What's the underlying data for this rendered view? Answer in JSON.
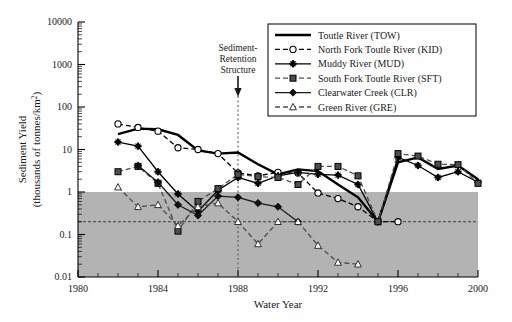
{
  "chart_data": {
    "type": "line",
    "title": "",
    "xlabel": "Water Year",
    "ylabel": "Sediment Yield\n(thousands of tonnes/km2)",
    "ylabel_line1": "Sediment Yield",
    "ylabel_line2": "(thousands of tonnes/km",
    "ylabel_sup": "2",
    "ylabel_close": ")",
    "yscale": "log",
    "xlim": [
      1980,
      2000
    ],
    "ylim": [
      0.01,
      10000
    ],
    "xticks": [
      1980,
      1984,
      1988,
      1992,
      1996,
      2000
    ],
    "xtick_labels": [
      "1980",
      "1984",
      "1988",
      "1992",
      "1996",
      "2000"
    ],
    "yticks": [
      0.01,
      0.1,
      1,
      10,
      100,
      1000,
      10000
    ],
    "ytick_labels": [
      "0.01",
      "0.1",
      "1",
      "10",
      "100",
      "1000",
      "10000"
    ],
    "grid": false,
    "legend_position": "top-right",
    "shaded_band": {
      "label": "background-yield-band",
      "y_from": 0.01,
      "y_to": 1,
      "color": "#b3b3b3"
    },
    "reference_line": {
      "label": "background-reference-line",
      "y": 0.2,
      "style": "dashed"
    },
    "annotation": {
      "text_line1": "Sediment-",
      "text_line2": "Retention",
      "text_line3": "Structure",
      "x": 1988,
      "style": "arrow-with-dotted-vertical"
    },
    "series": [
      {
        "name": "Toutle River (TOW)",
        "code": "TOW",
        "color": "#000000",
        "linestyle": "solid",
        "marker": "none",
        "x": [
          1982,
          1983,
          1984,
          1985,
          1986,
          1987,
          1988,
          1989,
          1990,
          1991,
          1992,
          1993,
          1994,
          1995,
          1996,
          1997,
          1998,
          1999,
          2000
        ],
        "values": [
          23,
          31,
          30,
          22,
          9.5,
          8.0,
          8.5,
          4.5,
          2.6,
          3.4,
          3.1,
          1.5,
          0.75,
          0.2,
          5.0,
          6.5,
          3.5,
          4.2,
          2.0
        ]
      },
      {
        "name": "North Fork Toutle River (KID)",
        "code": "KID",
        "color": "#000000",
        "linestyle": "dashed",
        "marker": "open-circle",
        "x": [
          1982,
          1983,
          1984,
          1985,
          1986,
          1987,
          1988,
          1989,
          1990,
          1991,
          1992,
          1993,
          1994,
          1995,
          1996
        ],
        "values": [
          40,
          33,
          27,
          11,
          10,
          8.0,
          2.8,
          2.4,
          2.9,
          2.8,
          0.95,
          0.7,
          0.45,
          0.2,
          0.2
        ]
      },
      {
        "name": "Muddy River (MUD)",
        "code": "MUD",
        "color": "#000000",
        "linestyle": "solid",
        "marker": "plus-star",
        "x": [
          1982,
          1983,
          1984,
          1985,
          1986,
          1987,
          1988,
          1989,
          1990,
          1991,
          1992,
          1993,
          1994,
          1995,
          1996,
          1997,
          1998,
          1999,
          2000
        ],
        "values": [
          15,
          12,
          3.0,
          0.9,
          0.35,
          1.1,
          2.2,
          1.6,
          2.4,
          2.9,
          2.6,
          2.5,
          1.5,
          0.2,
          6.5,
          4.2,
          2.2,
          3.0,
          1.7
        ]
      },
      {
        "name": "South Fork Toutle River (SFT)",
        "code": "SFT",
        "color": "#4d4d4d",
        "linestyle": "dashed",
        "marker": "filled-square",
        "x": [
          1982,
          1983,
          1984,
          1985,
          1986,
          1987,
          1988,
          1989,
          1990,
          1991,
          1992,
          1993,
          1994,
          1995,
          1996,
          1997,
          1998,
          1999,
          2000
        ],
        "values": [
          3.0,
          4.0,
          1.6,
          0.12,
          0.6,
          1.2,
          2.6,
          2.3,
          2.2,
          1.5,
          4.0,
          4.0,
          2.4,
          0.2,
          8.0,
          7.0,
          4.5,
          4.4,
          1.6
        ]
      },
      {
        "name": "Clearwater Creek (CLR)",
        "code": "CLR",
        "color": "#1a1a1a",
        "linestyle": "solid",
        "marker": "filled-diamond",
        "x": [
          1983,
          1984,
          1985,
          1986,
          1987,
          1988,
          1989,
          1990,
          1991
        ],
        "values": [
          4.2,
          1.7,
          0.5,
          0.28,
          0.8,
          0.75,
          0.55,
          0.45,
          0.2
        ]
      },
      {
        "name": "Green River (GRE)",
        "code": "GRE",
        "color": "#4d4d4d",
        "linestyle": "dashed",
        "marker": "open-triangle",
        "x": [
          1982,
          1983,
          1984,
          1985,
          1986,
          1987,
          1988,
          1989,
          1990,
          1991,
          1992,
          1993,
          1994
        ],
        "values": [
          1.3,
          0.45,
          0.5,
          0.16,
          0.45,
          0.55,
          0.2,
          0.06,
          0.2,
          0.2,
          0.055,
          0.022,
          0.02
        ]
      }
    ]
  }
}
